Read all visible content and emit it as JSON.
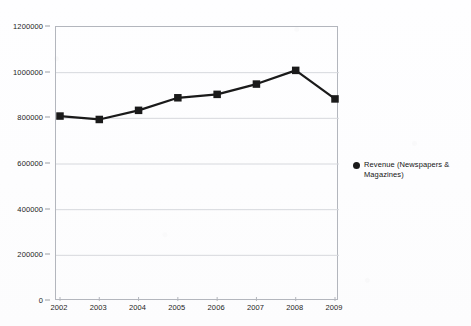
{
  "chart_data": {
    "type": "line",
    "title": "",
    "xlabel": "",
    "ylabel": "",
    "categories": [
      "2002",
      "2003",
      "2004",
      "2005",
      "2006",
      "2007",
      "2008",
      "2009"
    ],
    "values": [
      810000,
      795000,
      835000,
      890000,
      905000,
      950000,
      1010000,
      885000
    ],
    "series": [
      {
        "name": "Revenue (Newspapers & Magazines)",
        "values": [
          810000,
          795000,
          835000,
          890000,
          905000,
          950000,
          1010000,
          885000
        ]
      }
    ],
    "ylim": [
      0,
      1200000
    ],
    "ytick_labels": [
      "0",
      "200000",
      "400000",
      "600000",
      "800000",
      "1000000",
      "1200000"
    ],
    "ytick_values": [
      0,
      200000,
      400000,
      600000,
      800000,
      1000000,
      1200000
    ],
    "xtick_labels": [
      "2002",
      "2003",
      "2004",
      "2005",
      "2006",
      "2007",
      "2008",
      "2009"
    ],
    "grid": true,
    "legend_position": "right",
    "marker": "square",
    "series_color": "#1a1a1a",
    "grid_color": "#d6d8dd",
    "axis_color": "#b3b6bd"
  },
  "legend": {
    "marker_icon": "filled-circle-icon",
    "label": "Revenue (Newspapers & Magazines)"
  }
}
